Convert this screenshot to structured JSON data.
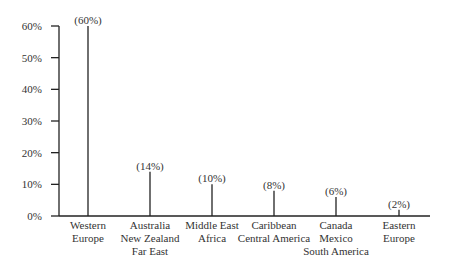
{
  "chart_data": {
    "type": "bar",
    "title": "",
    "xlabel": "",
    "ylabel": "",
    "ylim": [
      0,
      60
    ],
    "yticks": [
      "0%",
      "10%",
      "20%",
      "30%",
      "40%",
      "50%",
      "60%"
    ],
    "grid": false,
    "categories": [
      [
        "Western",
        "Europe"
      ],
      [
        "Australia",
        "New Zealand",
        "Far East"
      ],
      [
        "Middle East",
        "Africa"
      ],
      [
        "Caribbean",
        "Central America"
      ],
      [
        "Canada",
        "Mexico",
        "South America"
      ],
      [
        "Eastern",
        "Europe"
      ]
    ],
    "values": [
      60,
      14,
      10,
      8,
      6,
      2
    ],
    "labels": [
      "(60%)",
      "(14%)",
      "(10%)",
      "(8%)",
      "(6%)",
      "(2%)"
    ]
  }
}
